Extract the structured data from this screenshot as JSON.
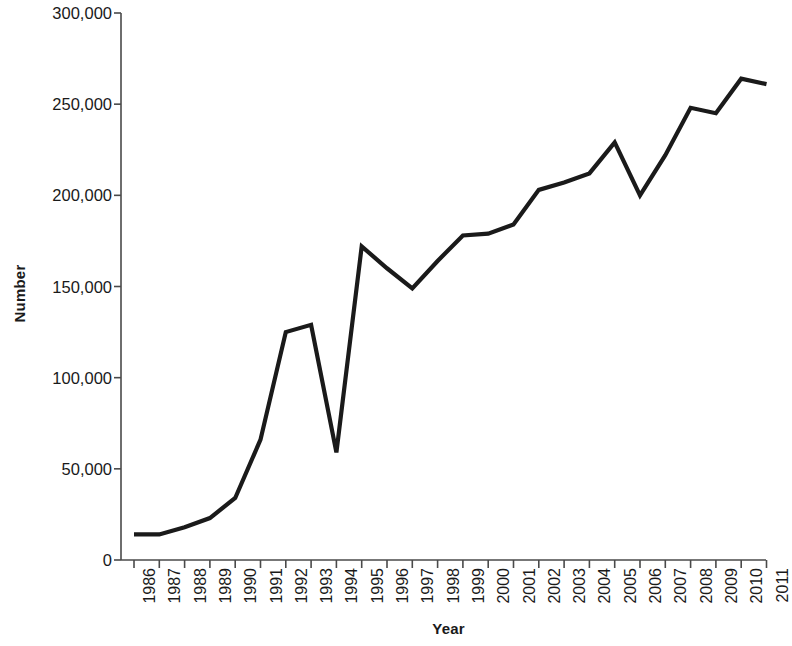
{
  "chart_data": {
    "type": "line",
    "title": "",
    "xlabel": "Year",
    "ylabel": "Number",
    "categories": [
      "1986",
      "1987",
      "1988",
      "1989",
      "1990",
      "1991",
      "1992",
      "1993",
      "1994",
      "1995",
      "1996",
      "1997",
      "1998",
      "1999",
      "2000",
      "2001",
      "2002",
      "2003",
      "2004",
      "2005",
      "2006",
      "2007",
      "2008",
      "2009",
      "2010",
      "2011"
    ],
    "values": [
      14000,
      14000,
      18000,
      23000,
      34000,
      66000,
      125000,
      129000,
      59000,
      172000,
      160000,
      149000,
      164000,
      178000,
      179000,
      184000,
      203000,
      207000,
      212000,
      229000,
      200000,
      222000,
      248000,
      245000,
      264000,
      261000
    ],
    "ylim": [
      0,
      300000
    ],
    "yticks": [
      0,
      50000,
      100000,
      150000,
      200000,
      250000,
      300000
    ],
    "ytick_labels": [
      "0",
      "50,000",
      "100,000",
      "150,000",
      "200,000",
      "250,000",
      "300,000"
    ],
    "grid": false,
    "legend": null,
    "line_color": "#1a1a1a",
    "axis_color": "#4a4a4a",
    "background_color": "#ffffff"
  }
}
